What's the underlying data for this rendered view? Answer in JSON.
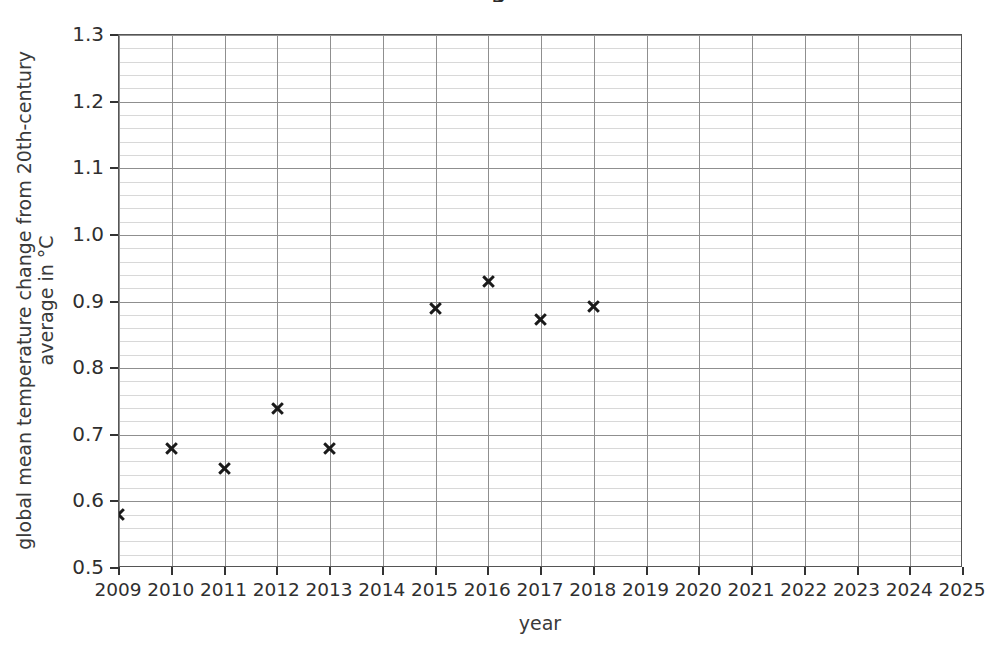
{
  "chart_data": {
    "type": "scatter",
    "title": "",
    "xlabel": "year",
    "ylabel": "global mean temperature change from 20th-century average in °C",
    "ylabel_line1": "global mean temperature change from 20th-century",
    "ylabel_line2": "average in °C",
    "xlim": [
      2009,
      2025
    ],
    "ylim": [
      0.5,
      1.3
    ],
    "x_tick_labels": [
      "2009",
      "2010",
      "2011",
      "2012",
      "2013",
      "2014",
      "2015",
      "2016",
      "2017",
      "2018",
      "2019",
      "2020",
      "2021",
      "2022",
      "2023",
      "2024",
      "2025"
    ],
    "x_ticks": [
      2009,
      2010,
      2011,
      2012,
      2013,
      2014,
      2015,
      2016,
      2017,
      2018,
      2019,
      2020,
      2021,
      2022,
      2023,
      2024,
      2025
    ],
    "y_tick_labels": [
      "0.5",
      "0.6",
      "0.7",
      "0.8",
      "0.9",
      "1.0",
      "1.1",
      "1.2",
      "1.3"
    ],
    "y_ticks": [
      0.5,
      0.6,
      0.7,
      0.8,
      0.9,
      1.0,
      1.1,
      1.2,
      1.3
    ],
    "y_minor_step": 0.02,
    "grid": true,
    "grid_major_color": "#8f8f8f",
    "grid_minor_color": "#d8d8d8",
    "marker_symbol": "x",
    "marker_color": "#1a1a1a",
    "legend": null,
    "x": [
      2009,
      2010,
      2011,
      2012,
      2013,
      2015,
      2016,
      2017,
      2018
    ],
    "values": [
      0.58,
      0.68,
      0.65,
      0.74,
      0.68,
      0.89,
      0.93,
      0.873,
      0.893
    ],
    "points": [
      {
        "year": 2009,
        "value": 0.58
      },
      {
        "year": 2010,
        "value": 0.68
      },
      {
        "year": 2011,
        "value": 0.65
      },
      {
        "year": 2012,
        "value": 0.74
      },
      {
        "year": 2013,
        "value": 0.68
      },
      {
        "year": 2015,
        "value": 0.89
      },
      {
        "year": 2016,
        "value": 0.93
      },
      {
        "year": 2017,
        "value": 0.873
      },
      {
        "year": 2018,
        "value": 0.893
      }
    ],
    "missing_years": [
      2014,
      2019,
      2020,
      2021,
      2022,
      2023,
      2024,
      2025
    ]
  },
  "title_fragment": "g"
}
